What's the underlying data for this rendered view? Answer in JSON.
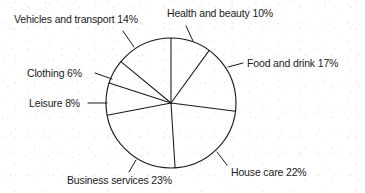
{
  "chart_data": {
    "type": "pie",
    "title": "",
    "subtitle": "",
    "xlabel": "",
    "ylabel": "",
    "legend_position": "none",
    "grid": false,
    "units": "percent",
    "total": 100,
    "start_angle_deg": 0,
    "direction": "clockwise",
    "categories": [
      "Health and beauty",
      "Food and drink",
      "House care",
      "Business services",
      "Leisure",
      "Clothing",
      "Vehicles and transport"
    ],
    "values": [
      10,
      17,
      22,
      23,
      8,
      6,
      14
    ],
    "slices": [
      {
        "name": "Health and beauty",
        "value": 10,
        "value_text": "10%",
        "label": "Health and beauty 10%",
        "start_deg": 0,
        "end_deg": 36,
        "label_pos": "top-right",
        "leader": "true"
      },
      {
        "name": "Food and drink",
        "value": 17,
        "value_text": "17%",
        "label": "Food and drink 17%",
        "start_deg": 36,
        "end_deg": 97.2,
        "label_pos": "right",
        "leader": "true"
      },
      {
        "name": "House care",
        "value": 22,
        "value_text": "22%",
        "label": "House care 22%",
        "start_deg": 97.2,
        "end_deg": 176.4,
        "label_pos": "bottom-right",
        "leader": "true"
      },
      {
        "name": "Business services",
        "value": 23,
        "value_text": "23%",
        "label": "Business services 23%",
        "start_deg": 176.4,
        "end_deg": 259.2,
        "label_pos": "bottom-left",
        "leader": "true"
      },
      {
        "name": "Leisure",
        "value": 8,
        "value_text": "8%",
        "label": "Leisure 8%",
        "start_deg": 259.2,
        "end_deg": 288,
        "label_pos": "left",
        "leader": "true"
      },
      {
        "name": "Clothing",
        "value": 6,
        "value_text": "6%",
        "label": "Clothing 6%",
        "start_deg": 288,
        "end_deg": 309.6,
        "label_pos": "upper-left",
        "leader": "true"
      },
      {
        "name": "Vehicles and transport",
        "value": 14,
        "value_text": "14%",
        "label": "Vehicles and transport 14%",
        "start_deg": 309.6,
        "end_deg": 360,
        "label_pos": "top-left",
        "leader": "true"
      }
    ],
    "style": {
      "stroke": "#1a1a1a",
      "fill": "#ffffff",
      "background": "#ffffff",
      "stroke_width": 1.1
    },
    "geometry": {
      "center_x": 171,
      "center_y": 103,
      "radius": 65
    }
  }
}
